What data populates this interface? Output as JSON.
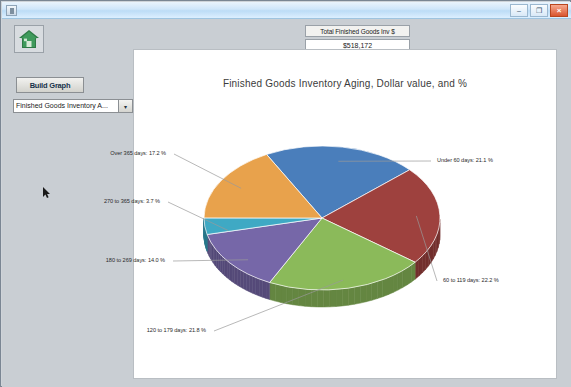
{
  "window": {
    "title": "",
    "buttons": {
      "minimize": "–",
      "maximize": "❐",
      "close": "×"
    }
  },
  "toolbar": {
    "home_icon": "home-icon"
  },
  "summary": {
    "total_label": "Total Finished Goods Inv $",
    "total_value": "$518,172"
  },
  "controls": {
    "build_graph_label": "Build Graph",
    "report_select_value": "Finished Goods Inventory A...",
    "report_select_arrow": "▾"
  },
  "chart_data": {
    "type": "pie",
    "title": "Finished Goods Inventory Aging, Dollar value, and %",
    "xlabel": "",
    "ylabel": "",
    "legend_position": "none",
    "grid": false,
    "categories": [
      "Under 60 days",
      "60 to 119 days",
      "120 to 179 days",
      "180 to 269 days",
      "270 to 365 days",
      "Over 365 days"
    ],
    "values": [
      21.1,
      22.2,
      21.8,
      14.0,
      3.7,
      17.2
    ],
    "colors": [
      "#4a7ebb",
      "#9e413e",
      "#8bba5a",
      "#7667a8",
      "#3fa9c4",
      "#e8a24c"
    ],
    "labels": [
      "Under 60 days: 21.1 %",
      "60 to 119 days: 22.2 %",
      "120 to 179 days: 21.8 %",
      "180 to 269 days: 14.0 %",
      "270 to 365 days: 3.7 %",
      "Over 365 days: 17.2 %"
    ]
  }
}
